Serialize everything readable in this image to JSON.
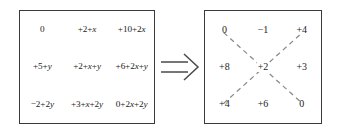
{
  "figure": {
    "background_color": "#ffffff",
    "border_color": "#3a3a3a",
    "dashed_line_color": "#8a8a8a",
    "text_color": "#1c1c1c"
  },
  "expression_grid": {
    "name": "expression-grid",
    "rows": 3,
    "columns": 3,
    "cells": [
      [
        "0",
        "+2+x",
        "+10+2x"
      ],
      [
        "+5+y",
        "+2+x+y",
        "+6+2x+y"
      ],
      [
        "−2+2y",
        "+3+x+2y",
        "0+2x+2y"
      ]
    ]
  },
  "arrow": {
    "name": "implies-arrow",
    "glyph": "⟹",
    "direction": "right",
    "style": "double-line-hollow"
  },
  "numeric_grid": {
    "name": "numeric-grid",
    "rows": 3,
    "columns": 3,
    "cells": [
      [
        "0",
        "−1",
        "+4"
      ],
      [
        "+8",
        "+2",
        "+3"
      ],
      [
        "+4",
        "+6",
        "0"
      ]
    ],
    "diagonals": [
      {
        "name": "diagonal-tl-br",
        "from": "top-left",
        "to": "bottom-right",
        "style": "dashed"
      },
      {
        "name": "diagonal-bl-tr",
        "from": "bottom-left",
        "to": "top-right",
        "style": "dashed"
      }
    ],
    "center_value": "+2"
  }
}
